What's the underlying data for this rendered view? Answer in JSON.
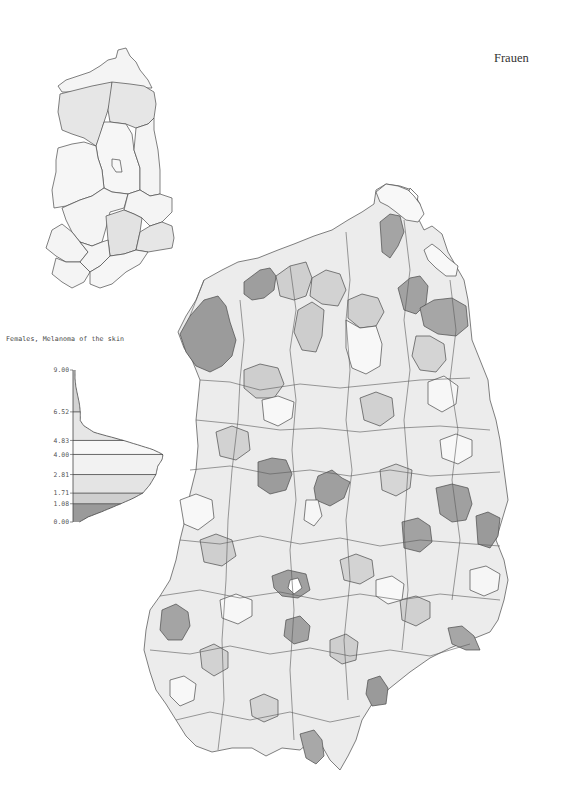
{
  "header": {
    "title": "Frauen"
  },
  "legend": {
    "title": "Females, Melanoma of the skin",
    "class_colors": [
      "#9a9a9a",
      "#cfcfcf",
      "#e4e4e4",
      "#f2f2f2",
      "#f8f8f8",
      "#e6e6e6",
      "#d3d3d3",
      "#9c9c9c"
    ]
  },
  "chart_data": {
    "type": "area",
    "title": "Females, Melanoma of the skin",
    "orientation": "vertical-distribution",
    "ylabel": "",
    "xlabel": "",
    "ylim": [
      0.0,
      9.0
    ],
    "tick_labels": [
      "9.00",
      "6.52",
      "4.83",
      "4.00",
      "2.81",
      "1.71",
      "1.08",
      "0.00"
    ],
    "class_breaks": [
      0.0,
      1.08,
      1.71,
      2.81,
      4.0,
      4.83,
      6.52,
      9.0
    ],
    "distribution": {
      "rate": [
        0.0,
        0.3,
        0.6,
        1.08,
        1.4,
        1.71,
        2.2,
        2.81,
        3.3,
        3.7,
        4.0,
        4.3,
        4.83,
        5.3,
        5.7,
        6.0,
        6.52,
        7.0,
        7.5,
        8.0,
        8.5,
        9.0
      ],
      "density": [
        0.05,
        0.15,
        0.3,
        0.52,
        0.66,
        0.77,
        0.85,
        0.92,
        0.94,
        0.99,
        1.0,
        0.88,
        0.55,
        0.22,
        0.1,
        0.06,
        0.06,
        0.05,
        0.03,
        0.01,
        0.0,
        0.0
      ]
    },
    "legend_placement": "left"
  },
  "maps": {
    "overview_map": {
      "description": "Bezirke (15 districts) overview"
    },
    "main_map": {
      "description": "Kreise (districts) choropleth"
    }
  }
}
